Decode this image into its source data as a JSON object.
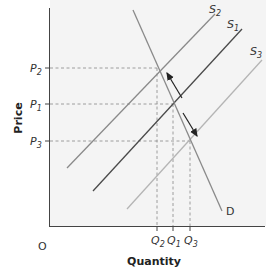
{
  "chart_data": {
    "type": "line",
    "title": "",
    "xlabel": "Quantity",
    "ylabel": "Price",
    "origin_label": "O",
    "grid": false,
    "legend": null,
    "series": [
      {
        "name": "S2",
        "label": "S",
        "sub": "2",
        "color": "#8a8a8a",
        "points": [
          [
            67,
            168
          ],
          [
            215,
            14
          ]
        ]
      },
      {
        "name": "S1",
        "label": "S",
        "sub": "1",
        "color": "#4a4a4a",
        "points": [
          [
            93,
            191
          ],
          [
            242,
            29
          ]
        ]
      },
      {
        "name": "S3",
        "label": "S",
        "sub": "3",
        "color": "#b5b5b5",
        "points": [
          [
            127,
            209
          ],
          [
            262,
            60
          ]
        ]
      },
      {
        "name": "D",
        "label": "D",
        "sub": "",
        "color": "#8a8a8a",
        "points": [
          [
            133,
            10
          ],
          [
            222,
            211
          ]
        ]
      }
    ],
    "price_ticks": [
      {
        "label": "P",
        "sub": "2",
        "y": 68
      },
      {
        "label": "P",
        "sub": "1",
        "y": 104
      },
      {
        "label": "P",
        "sub": "3",
        "y": 141
      }
    ],
    "quantity_ticks": [
      {
        "label": "Q",
        "sub": "2",
        "x": 157
      },
      {
        "label": "Q",
        "sub": "1",
        "x": 173
      },
      {
        "label": "Q",
        "sub": "3",
        "x": 190
      }
    ],
    "equilibria": [
      {
        "name": "E2",
        "q": "Q2",
        "p": "P2"
      },
      {
        "name": "E1",
        "q": "Q1",
        "p": "P1"
      },
      {
        "name": "E3",
        "q": "Q3",
        "p": "P3"
      }
    ],
    "annotations": [
      {
        "type": "arrow",
        "direction": "up-left along D",
        "from": [
          182,
          98
        ],
        "to": [
          167,
          73
        ]
      },
      {
        "type": "arrow",
        "direction": "down-right along D",
        "from": [
          183,
          113
        ],
        "to": [
          197,
          136
        ]
      }
    ]
  }
}
